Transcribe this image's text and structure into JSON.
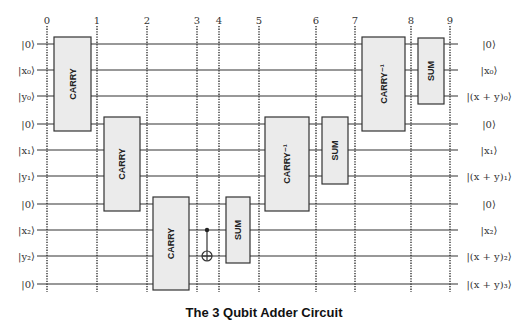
{
  "title": "The 3 Qubit Adder Circuit",
  "time_steps": [
    {
      "label": "0",
      "x": 47
    },
    {
      "label": "1",
      "x": 97
    },
    {
      "label": "2",
      "x": 147
    },
    {
      "label": "3",
      "x": 197
    },
    {
      "label": "4",
      "x": 219
    },
    {
      "label": "5",
      "x": 259
    },
    {
      "label": "6",
      "x": 316
    },
    {
      "label": "7",
      "x": 355
    },
    {
      "label": "8",
      "x": 411
    },
    {
      "label": "9",
      "x": 450
    }
  ],
  "wires": [
    {
      "y": 44,
      "input": "|0⟩",
      "output": "|0⟩"
    },
    {
      "y": 70,
      "input": "|x₀⟩",
      "output": "|x₀⟩"
    },
    {
      "y": 96,
      "input": "|y₀⟩",
      "output": "|(x + y)₀⟩"
    },
    {
      "y": 124,
      "input": "|0⟩",
      "output": "|0⟩"
    },
    {
      "y": 150,
      "input": "|x₁⟩",
      "output": "|x₁⟩"
    },
    {
      "y": 176,
      "input": "|y₁⟩",
      "output": "|(x + y)₁⟩"
    },
    {
      "y": 204,
      "input": "|0⟩",
      "output": "|0⟩"
    },
    {
      "y": 230,
      "input": "|x₂⟩",
      "output": "|x₂⟩"
    },
    {
      "y": 256,
      "input": "|y₂⟩",
      "output": "|(x + y)₂⟩"
    },
    {
      "y": 284,
      "input": "|0⟩",
      "output": "|(x + y)₃⟩"
    }
  ],
  "gates": [
    {
      "label": "CARRY",
      "x": 54,
      "y": 37,
      "w": 37,
      "h": 94
    },
    {
      "label": "CARRY",
      "x": 104,
      "y": 117,
      "w": 36,
      "h": 94
    },
    {
      "label": "CARRY",
      "x": 153,
      "y": 197,
      "w": 36,
      "h": 93
    },
    {
      "label": "SUM",
      "x": 226,
      "y": 197,
      "w": 24,
      "h": 66
    },
    {
      "label": "CARRY⁻¹",
      "x": 265,
      "y": 117,
      "w": 44,
      "h": 94
    },
    {
      "label": "SUM",
      "x": 322,
      "y": 117,
      "w": 26,
      "h": 67
    },
    {
      "label": "CARRY⁻¹",
      "x": 362,
      "y": 37,
      "w": 43,
      "h": 94
    },
    {
      "label": "SUM",
      "x": 418,
      "y": 38,
      "w": 26,
      "h": 66
    }
  ],
  "cnot": {
    "x": 207,
    "control_y": 230,
    "target_y": 256
  },
  "colors": {
    "gate_fill": "#ebebeb",
    "gate_stroke": "#333333",
    "wire": "#333333",
    "dots": "#222222"
  }
}
